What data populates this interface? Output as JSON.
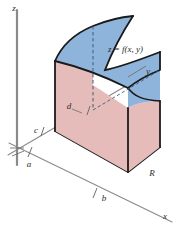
{
  "figure": {
    "name": "double-integral-volume-under-surface",
    "background_color": "#ffffff",
    "axes": {
      "z_label": "z",
      "y_label": "y",
      "x_label": "x",
      "axis_color": "#8a8a8a"
    },
    "ticks": {
      "a": "a",
      "b": "b",
      "c": "c",
      "d": "d"
    },
    "labels": {
      "surface_equation": "z = f(x, y)",
      "region": "R"
    },
    "colors": {
      "surface_top": "#8fb4dc",
      "face_pink": "#e5bcb9",
      "base_blue": "#bcd3e7",
      "outline": "#1a1a1a",
      "dashed": "#3f5a7a",
      "axis_gray": "#8a8a8a"
    }
  }
}
